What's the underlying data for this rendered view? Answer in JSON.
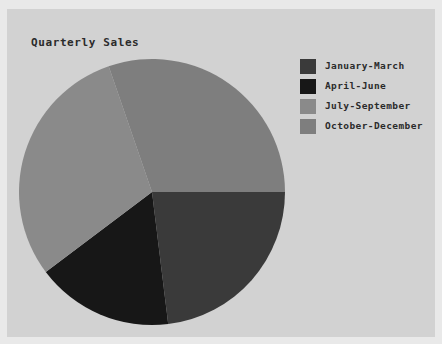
{
  "panel": {
    "background_color": "#d2d2d2",
    "page_background_color": "#e9e9e9"
  },
  "chart_data": {
    "type": "pie",
    "title": "Quarterly Sales",
    "xlabel": "",
    "ylabel": "",
    "grid": false,
    "legend_position": "right",
    "start_angle_deg": 0,
    "direction": "clockwise",
    "categories": [
      "January-March",
      "April-June",
      "July-September",
      "October-December"
    ],
    "values": [
      23,
      17,
      30,
      30
    ],
    "slice_angles_deg": [
      83,
      60,
      108,
      109
    ],
    "colors": [
      "#3a3a3a",
      "#171717",
      "#8a8a8a",
      "#7e7e7e"
    ],
    "slices": [
      {
        "label": "January-March",
        "value": 23,
        "angle_deg": 83,
        "percent": "23%",
        "color": "#3a3a3a"
      },
      {
        "label": "April-June",
        "value": 17,
        "angle_deg": 60,
        "percent": "17%",
        "color": "#171717"
      },
      {
        "label": "July-September",
        "value": 30,
        "angle_deg": 108,
        "percent": "30%",
        "color": "#8a8a8a"
      },
      {
        "label": "October-December",
        "value": 30,
        "angle_deg": 109,
        "percent": "30%",
        "color": "#7e7e7e"
      }
    ]
  },
  "legend": {
    "items": [
      {
        "label": "January-March",
        "color": "#3a3a3a"
      },
      {
        "label": "April-June",
        "color": "#171717"
      },
      {
        "label": "July-September",
        "color": "#8a8a8a"
      },
      {
        "label": "October-December",
        "color": "#7e7e7e"
      }
    ]
  }
}
